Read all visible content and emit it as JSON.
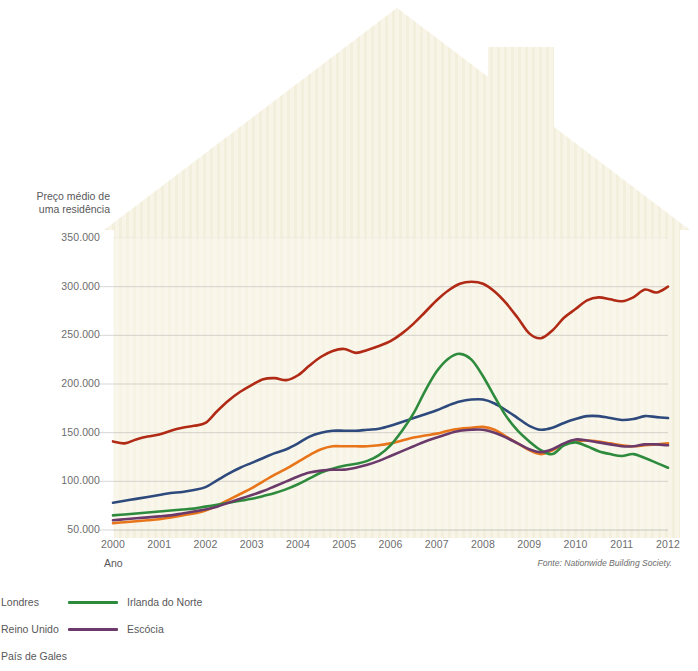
{
  "axes": {
    "y_title": "Preço médio de\numa residência",
    "x_title": "Ano",
    "y_ticks": [
      "350.000",
      "300.000",
      "250.000",
      "200.000",
      "150.000",
      "100.000",
      "50.000"
    ],
    "x_ticks": [
      "2000",
      "2001",
      "2002",
      "2003",
      "2004",
      "2005",
      "2006",
      "2007",
      "2008",
      "2009",
      "2010",
      "2011",
      "2012"
    ]
  },
  "source": "Fonte: Nationwide Building Society.",
  "legend": {
    "items": [
      {
        "label": "Londres",
        "color": "#b02a16",
        "column": 1,
        "row": 0
      },
      {
        "label": "Reino Unido",
        "color": "#2e4a7d",
        "column": 1,
        "row": 1
      },
      {
        "label": "País de Gales",
        "color": "#e8751a",
        "column": 1,
        "row": 2
      },
      {
        "label": "Irlanda do Norte",
        "color": "#2e8b3d",
        "column": 2,
        "row": 0
      },
      {
        "label": "Escócia",
        "color": "#6b3a6b",
        "column": 2,
        "row": 1
      }
    ]
  },
  "colors": {
    "londres": "#b02a16",
    "reino_unido": "#2e4a7d",
    "pais_de_gales": "#e8751a",
    "irlanda_do_norte": "#2e8b3d",
    "escocia": "#6b3a6b",
    "gridline": "#9a9a9a",
    "house_fill": "#f7f3e4",
    "plot_background": "#faf7ec"
  },
  "chart_data": {
    "type": "line",
    "title": "",
    "xlabel": "Ano",
    "ylabel": "Preço médio de uma residência",
    "xlim": [
      2000,
      2012
    ],
    "ylim": [
      40000,
      350000
    ],
    "grid": "horizontal",
    "legend_position": "below-left",
    "x": [
      2000,
      2000.25,
      2000.5,
      2000.75,
      2001,
      2001.25,
      2001.5,
      2001.75,
      2002,
      2002.25,
      2002.5,
      2002.75,
      2003,
      2003.25,
      2003.5,
      2003.75,
      2004,
      2004.25,
      2004.5,
      2004.75,
      2005,
      2005.25,
      2005.5,
      2005.75,
      2006,
      2006.25,
      2006.5,
      2006.75,
      2007,
      2007.25,
      2007.5,
      2007.75,
      2008,
      2008.25,
      2008.5,
      2008.75,
      2009,
      2009.25,
      2009.5,
      2009.75,
      2010,
      2010.25,
      2010.5,
      2010.75,
      2011,
      2011.25,
      2011.5,
      2011.75,
      2012
    ],
    "series": [
      {
        "name": "Londres",
        "color": "#b02a16",
        "values": [
          141000,
          139000,
          143000,
          146000,
          148000,
          152000,
          155000,
          157000,
          160000,
          172000,
          183000,
          192000,
          199000,
          205000,
          206000,
          204000,
          209000,
          219000,
          228000,
          234000,
          236000,
          232000,
          235000,
          239000,
          244000,
          252000,
          262000,
          274000,
          286000,
          296000,
          303000,
          305000,
          303000,
          295000,
          283000,
          268000,
          252000,
          247000,
          255000,
          268000,
          277000,
          286000,
          289000,
          287000,
          285000,
          289000,
          297000,
          294000,
          300000
        ]
      },
      {
        "name": "Reino Unido",
        "color": "#2e4a7d",
        "values": [
          78000,
          80000,
          82000,
          84000,
          86000,
          88000,
          89000,
          91000,
          94000,
          101000,
          108000,
          114000,
          119000,
          124000,
          129000,
          133000,
          139000,
          146000,
          150000,
          152000,
          152000,
          152000,
          153000,
          154000,
          157000,
          161000,
          165000,
          169000,
          173000,
          178000,
          182000,
          184000,
          184000,
          180000,
          173000,
          165000,
          157000,
          153000,
          155000,
          160000,
          164000,
          167000,
          167000,
          165000,
          163000,
          164000,
          167000,
          166000,
          165000
        ]
      },
      {
        "name": "País de Gales",
        "color": "#e8751a",
        "values": [
          57000,
          58000,
          59000,
          60000,
          61000,
          63000,
          65000,
          67000,
          70000,
          75000,
          81000,
          87000,
          93000,
          100000,
          107000,
          113000,
          120000,
          127000,
          133000,
          136000,
          136000,
          136000,
          136000,
          137000,
          139000,
          142000,
          145000,
          147000,
          149000,
          152000,
          154000,
          155000,
          156000,
          153000,
          146000,
          139000,
          132000,
          128000,
          132000,
          138000,
          141000,
          142000,
          141000,
          139000,
          137000,
          136000,
          137000,
          138000,
          139000
        ]
      },
      {
        "name": "Irlanda do Norte",
        "color": "#2e8b3d",
        "values": [
          65000,
          66000,
          67000,
          68000,
          69000,
          70000,
          71000,
          72000,
          74000,
          76000,
          78000,
          80000,
          82000,
          85000,
          88000,
          92000,
          97000,
          103000,
          109000,
          113000,
          116000,
          118000,
          121000,
          127000,
          137000,
          152000,
          170000,
          193000,
          213000,
          226000,
          231000,
          225000,
          208000,
          187000,
          167000,
          152000,
          141000,
          132000,
          128000,
          137000,
          140000,
          136000,
          131000,
          128000,
          126000,
          128000,
          124000,
          119000,
          114000
        ]
      },
      {
        "name": "Escócia",
        "color": "#6b3a6b",
        "values": [
          60000,
          61000,
          62000,
          63000,
          64000,
          65000,
          67000,
          69000,
          71000,
          74000,
          78000,
          82000,
          86000,
          90000,
          95000,
          100000,
          105000,
          109000,
          111000,
          112000,
          112000,
          114000,
          117000,
          121000,
          126000,
          131000,
          136000,
          141000,
          145000,
          149000,
          152000,
          153000,
          153000,
          150000,
          145000,
          139000,
          133000,
          130000,
          133000,
          139000,
          143000,
          142000,
          140000,
          138000,
          136000,
          136000,
          138000,
          138000,
          137000
        ]
      }
    ]
  }
}
